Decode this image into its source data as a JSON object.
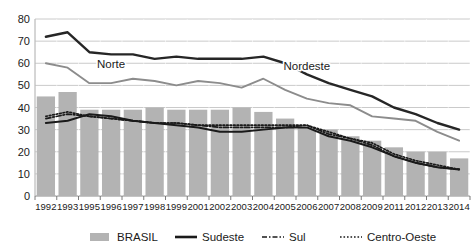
{
  "chart_data": {
    "type": "bar",
    "title": "",
    "xlabel": "",
    "ylabel": "",
    "ylim": [
      0,
      80
    ],
    "ytick_step": 10,
    "yticks": [
      "0",
      "10",
      "20",
      "30",
      "40",
      "50",
      "60",
      "70",
      "80"
    ],
    "grid": true,
    "legend_position": "bottom",
    "categories": [
      "1992",
      "1993",
      "1995",
      "1996",
      "1997",
      "1998",
      "1999",
      "2001",
      "2002",
      "2003",
      "2004",
      "2005",
      "2006",
      "2007",
      "2008",
      "2009",
      "2011",
      "2012",
      "2013",
      "2014"
    ],
    "series": [
      {
        "name": "BRASIL",
        "render": "bar",
        "color": "#b3b3b3",
        "values": [
          45,
          47,
          39,
          39,
          39,
          40,
          39,
          39,
          39,
          40,
          38,
          35,
          31,
          30,
          27,
          25,
          22,
          20,
          20,
          17
        ]
      },
      {
        "name": "Sudeste",
        "render": "line-solid",
        "color": "#1a1a1a",
        "values": [
          33,
          34,
          37,
          36,
          34,
          33,
          32,
          31,
          29,
          29,
          30,
          31,
          31,
          27,
          25,
          22,
          18,
          15,
          13,
          12
        ]
      },
      {
        "name": "Sul",
        "render": "line-dashdot",
        "color": "#1a1a1a",
        "values": [
          35,
          37,
          36,
          35,
          34,
          33,
          33,
          32,
          31,
          31,
          31,
          31,
          32,
          28,
          26,
          23,
          18,
          15,
          13,
          12
        ]
      },
      {
        "name": "Centro-Oeste",
        "render": "line-dotted",
        "color": "#1a1a1a",
        "values": [
          36,
          38,
          36,
          35,
          34,
          33,
          33,
          32,
          32,
          32,
          32,
          32,
          32,
          29,
          26,
          24,
          19,
          16,
          14,
          12
        ]
      },
      {
        "name": "Nordeste",
        "render": "line-solid-thick",
        "color": "#262626",
        "values": [
          72,
          74,
          65,
          64,
          64,
          62,
          63,
          62,
          62,
          62,
          63,
          60,
          55,
          51,
          48,
          45,
          40,
          37,
          33,
          30
        ]
      },
      {
        "name": "Norte",
        "render": "line-solid-gray",
        "color": "#8c8c8c",
        "values": [
          60,
          58,
          51,
          51,
          53,
          52,
          50,
          52,
          51,
          49,
          53,
          48,
          44,
          42,
          41,
          36,
          35,
          34,
          29,
          25
        ]
      }
    ],
    "inline_annotations": [
      {
        "text": "Norte",
        "category": "1996",
        "value": 58
      },
      {
        "text": "Nordeste",
        "category": "2006",
        "value": 57
      }
    ],
    "legend": [
      {
        "label": "BRASIL",
        "marker": "bar-swatch",
        "color": "#b3b3b3"
      },
      {
        "label": "Sudeste",
        "marker": "line-solid",
        "color": "#1a1a1a"
      },
      {
        "label": "Sul",
        "marker": "line-dashdot",
        "color": "#1a1a1a"
      },
      {
        "label": "Centro-Oeste",
        "marker": "line-dotted",
        "color": "#1a1a1a"
      }
    ]
  }
}
